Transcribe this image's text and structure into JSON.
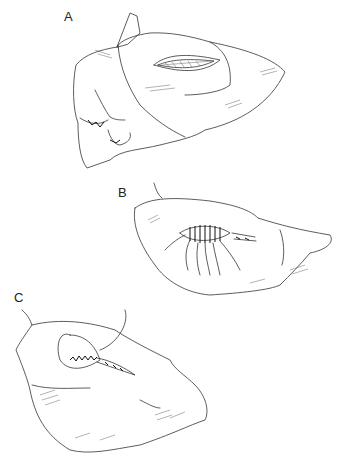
{
  "figure": {
    "panels": [
      {
        "id": "A",
        "label": "A",
        "description": "Organ with open elliptical incision"
      },
      {
        "id": "B",
        "label": "B",
        "description": "Incision with multiple placed sutures"
      },
      {
        "id": "C",
        "label": "C",
        "description": "Incision closed with running suture"
      }
    ]
  }
}
